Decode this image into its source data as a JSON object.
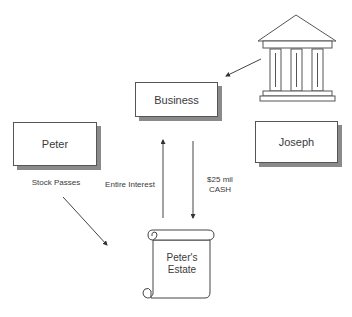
{
  "diagram": {
    "nodes": {
      "business": {
        "label": "Business"
      },
      "peter": {
        "label": "Peter"
      },
      "joseph": {
        "label": "Joseph"
      },
      "estate": {
        "label_line1": "Peter's",
        "label_line2": "Estate"
      },
      "bank": {
        "icon": "bank-building-icon"
      }
    },
    "edges": {
      "stock_passes": {
        "label": "Stock Passes"
      },
      "entire_interest": {
        "label": "Entire Interest"
      },
      "cash": {
        "label_line1": "$25 mil",
        "label_line2": "CASH"
      }
    }
  },
  "colors": {
    "line": "#444444",
    "shadow": "#8a8a8a",
    "text": "#3a3a3a"
  }
}
